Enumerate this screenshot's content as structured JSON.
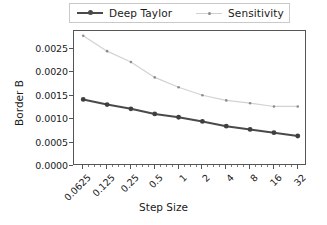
{
  "chart_data": {
    "type": "line",
    "title": "",
    "xlabel": "Step Size",
    "ylabel": "Border B",
    "xscale": "log2",
    "x": [
      0.0625,
      0.125,
      0.25,
      0.5,
      1,
      2,
      4,
      8,
      16,
      32
    ],
    "xtick_labels": [
      "0.0625",
      "0.125",
      "0.25",
      "0.5",
      "1",
      "2",
      "4",
      "8",
      "16",
      "32"
    ],
    "ytick_labels": [
      "0.0000",
      "0.0005",
      "0.0010",
      "0.0015",
      "0.0020",
      "0.0025"
    ],
    "ytick_values": [
      0.0,
      0.0005,
      0.001,
      0.0015,
      0.002,
      0.0025
    ],
    "ylim": [
      0.0,
      0.00288
    ],
    "grid": false,
    "legend_position": "upper center, outside axes",
    "series": [
      {
        "name": "Deep Taylor",
        "color": "#4a4a4a",
        "marker": "circle",
        "linewidth": 2,
        "values": [
          0.00142,
          0.00131,
          0.00122,
          0.00111,
          0.00104,
          0.00095,
          0.00085,
          0.00078,
          0.00071,
          0.00064
        ]
      },
      {
        "name": "Sensitivity",
        "color": "#d0d0d0",
        "marker": "dot",
        "linewidth": 1,
        "values": [
          0.00278,
          0.00245,
          0.00222,
          0.00189,
          0.00168,
          0.00151,
          0.0014,
          0.00134,
          0.00127,
          0.00127
        ]
      }
    ]
  },
  "legend": {
    "entries": [
      {
        "label": "Deep Taylor"
      },
      {
        "label": "Sensitivity"
      }
    ]
  },
  "axes": {
    "y_label": "Border B",
    "x_label": "Step Size"
  }
}
